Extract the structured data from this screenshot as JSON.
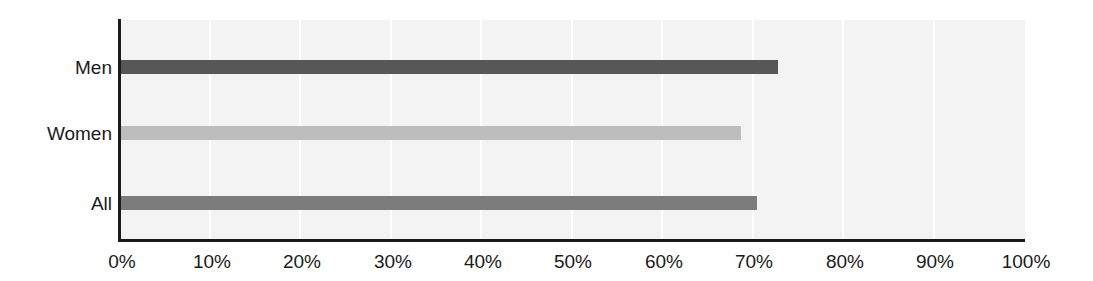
{
  "chart_data": {
    "type": "bar",
    "orientation": "horizontal",
    "title": "",
    "subtitle": "",
    "xlabel": "",
    "ylabel": "",
    "categories": [
      "Men",
      "Women",
      "All"
    ],
    "values": [
      72.7,
      68.6,
      70.4
    ],
    "series": [
      {
        "name": "Percent",
        "values": [
          72.7,
          68.6,
          70.4
        ]
      }
    ],
    "bar_colors": [
      "#575757",
      "#bdbdbd",
      "#7c7c7c"
    ],
    "xlim": [
      0,
      100
    ],
    "xticks": [
      0,
      10,
      20,
      30,
      40,
      50,
      60,
      70,
      80,
      90,
      100
    ],
    "xtick_labels": [
      "0%",
      "10%",
      "20%",
      "30%",
      "40%",
      "50%",
      "60%",
      "70%",
      "80%",
      "90%",
      "100%"
    ],
    "grid": true,
    "grid_axis": "x",
    "grid_color": "#ffffff",
    "plot_background": "#f3f3f3",
    "axis_color": "#1a1a1a",
    "legend": false,
    "legend_position": "none",
    "annotations": []
  },
  "axis": {
    "y_labels": [
      "Men",
      "Women",
      "All"
    ],
    "x_labels": [
      "0%",
      "10%",
      "20%",
      "30%",
      "40%",
      "50%",
      "60%",
      "70%",
      "80%",
      "90%",
      "100%"
    ]
  },
  "colors": {
    "men_bar": "#575757",
    "women_bar": "#bdbdbd",
    "all_bar": "#7c7c7c",
    "plot_bg": "#f3f3f3",
    "gridline": "#ffffff",
    "axis": "#1a1a1a",
    "text": "#1a1a1a",
    "page_bg": "#ffffff"
  }
}
